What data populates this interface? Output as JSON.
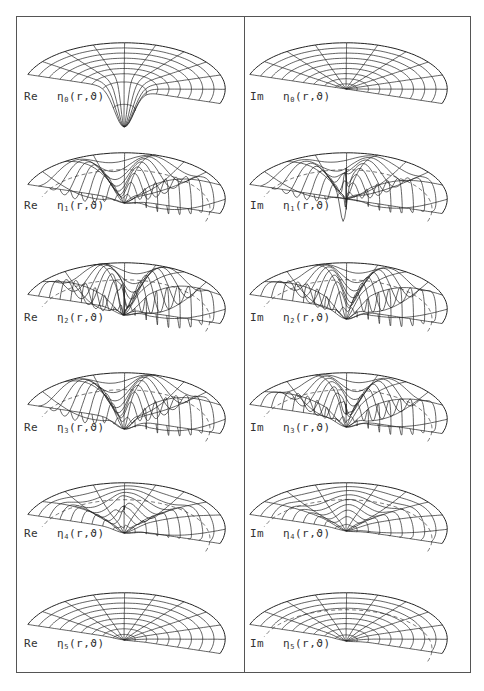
{
  "figure": {
    "columns": [
      "Re",
      "Im"
    ],
    "function_symbol": "η",
    "arguments": "(r,ϑ)",
    "panels": [
      {
        "row": 0,
        "col": 0,
        "part": "Re",
        "index": "0",
        "args": "(r,ϑ)"
      },
      {
        "row": 0,
        "col": 1,
        "part": "Im",
        "index": "0",
        "args": "(r,ϑ)"
      },
      {
        "row": 1,
        "col": 0,
        "part": "Re",
        "index": "1",
        "args": "(r,ϑ)"
      },
      {
        "row": 1,
        "col": 1,
        "part": "Im",
        "index": "1",
        "args": "(r,ϑ)"
      },
      {
        "row": 2,
        "col": 0,
        "part": "Re",
        "index": "2",
        "args": "(r,ϑ)"
      },
      {
        "row": 2,
        "col": 1,
        "part": "Im",
        "index": "2",
        "args": "(r,ϑ)"
      },
      {
        "row": 3,
        "col": 0,
        "part": "Re",
        "index": "3",
        "args": "(r,ϑ)"
      },
      {
        "row": 3,
        "col": 1,
        "part": "Im",
        "index": "3",
        "args": "(r,ϑ)"
      },
      {
        "row": 4,
        "col": 0,
        "part": "Re",
        "index": "4",
        "args": "(r,ϑ)"
      },
      {
        "row": 4,
        "col": 1,
        "part": "Im",
        "index": "4",
        "args": "(r,ϑ)"
      },
      {
        "row": 5,
        "col": 0,
        "part": "Re",
        "index": "5",
        "args": "(r,ϑ)"
      },
      {
        "row": 5,
        "col": 1,
        "part": "Im",
        "index": "5",
        "args": "(r,ϑ)"
      }
    ]
  },
  "colors": {
    "line": "#222222",
    "frame": "#555555",
    "background": "#ffffff"
  }
}
